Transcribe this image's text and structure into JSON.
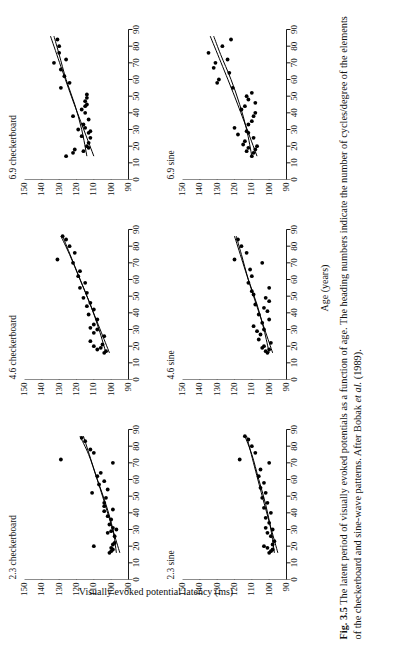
{
  "figure": {
    "caption_label": "Fig. 3.5",
    "caption_text_1": "The latent period of visually evoked potentials as a function of age. The heading numbers",
    "caption_text_2": "indicate the number of cycles/degree of the elements of the checkerboard and sine-wave patterns. After",
    "caption_text_3_pre": "Bobak ",
    "caption_text_3_ital": "et al.",
    "caption_text_3_post": " (1989)."
  },
  "chart_data": {
    "type": "scatter",
    "title": "The latent period of visually evoked potentials as a function of age",
    "xlabel": "Age (years)",
    "ylabel": "Visually evoked potential latency (ms)",
    "xlim": [
      0,
      90
    ],
    "ylim": [
      90,
      150
    ],
    "xticks": [
      0,
      10,
      20,
      30,
      40,
      50,
      60,
      70,
      80,
      90
    ],
    "yticks": [
      90,
      100,
      110,
      120,
      130,
      140,
      150
    ],
    "grid": false,
    "legend": "none",
    "annotation": "Each panel heading gives cycles/degree of the pattern elements; two fitted curves (linear and quadratic regression) are drawn on each panel.",
    "panels": [
      {
        "id": "panel-2-3-checkerboard",
        "title": "2.3 checkerboard",
        "row": 0,
        "col": 0,
        "spatial_frequency_cpd": 2.3,
        "pattern": "checkerboard",
        "points": [
          {
            "x": 16,
            "y": 101
          },
          {
            "x": 17,
            "y": 100
          },
          {
            "x": 18,
            "y": 99
          },
          {
            "x": 19,
            "y": 100
          },
          {
            "x": 20,
            "y": 110
          },
          {
            "x": 21,
            "y": 99
          },
          {
            "x": 22,
            "y": 98
          },
          {
            "x": 26,
            "y": 98
          },
          {
            "x": 28,
            "y": 102
          },
          {
            "x": 29,
            "y": 100
          },
          {
            "x": 30,
            "y": 97
          },
          {
            "x": 31,
            "y": 99
          },
          {
            "x": 33,
            "y": 101
          },
          {
            "x": 36,
            "y": 100
          },
          {
            "x": 38,
            "y": 102
          },
          {
            "x": 41,
            "y": 104
          },
          {
            "x": 42,
            "y": 99
          },
          {
            "x": 44,
            "y": 104
          },
          {
            "x": 46,
            "y": 104
          },
          {
            "x": 49,
            "y": 103
          },
          {
            "x": 52,
            "y": 111
          },
          {
            "x": 54,
            "y": 102
          },
          {
            "x": 57,
            "y": 107
          },
          {
            "x": 59,
            "y": 104
          },
          {
            "x": 62,
            "y": 108
          },
          {
            "x": 64,
            "y": 106
          },
          {
            "x": 70,
            "y": 99
          },
          {
            "x": 72,
            "y": 129
          },
          {
            "x": 76,
            "y": 110
          },
          {
            "x": 78,
            "y": 112
          },
          {
            "x": 83,
            "y": 115
          },
          {
            "x": 85,
            "y": 117
          }
        ],
        "fit_quadratic": [
          {
            "x": 16,
            "y": 97
          },
          {
            "x": 30,
            "y": 99
          },
          {
            "x": 45,
            "y": 103
          },
          {
            "x": 60,
            "y": 108
          },
          {
            "x": 75,
            "y": 113
          },
          {
            "x": 86,
            "y": 118
          }
        ],
        "fit_linear": [
          {
            "x": 16,
            "y": 95
          },
          {
            "x": 50,
            "y": 105
          },
          {
            "x": 86,
            "y": 116
          }
        ]
      },
      {
        "id": "panel-4-6-checkerboard",
        "title": "4.6 checkerboard",
        "row": 0,
        "col": 1,
        "spatial_frequency_cpd": 4.6,
        "pattern": "checkerboard",
        "points": [
          {
            "x": 16,
            "y": 104
          },
          {
            "x": 17,
            "y": 103
          },
          {
            "x": 18,
            "y": 108
          },
          {
            "x": 19,
            "y": 106
          },
          {
            "x": 20,
            "y": 110
          },
          {
            "x": 21,
            "y": 105
          },
          {
            "x": 23,
            "y": 112
          },
          {
            "x": 26,
            "y": 104
          },
          {
            "x": 28,
            "y": 110
          },
          {
            "x": 30,
            "y": 108
          },
          {
            "x": 31,
            "y": 112
          },
          {
            "x": 33,
            "y": 110
          },
          {
            "x": 36,
            "y": 108
          },
          {
            "x": 39,
            "y": 113
          },
          {
            "x": 42,
            "y": 110
          },
          {
            "x": 44,
            "y": 114
          },
          {
            "x": 46,
            "y": 112
          },
          {
            "x": 49,
            "y": 116
          },
          {
            "x": 52,
            "y": 114
          },
          {
            "x": 55,
            "y": 118
          },
          {
            "x": 58,
            "y": 115
          },
          {
            "x": 62,
            "y": 119
          },
          {
            "x": 65,
            "y": 118
          },
          {
            "x": 70,
            "y": 122
          },
          {
            "x": 72,
            "y": 131
          },
          {
            "x": 76,
            "y": 121
          },
          {
            "x": 80,
            "y": 124
          },
          {
            "x": 84,
            "y": 126
          },
          {
            "x": 86,
            "y": 128
          }
        ],
        "fit_quadratic": [
          {
            "x": 16,
            "y": 103
          },
          {
            "x": 30,
            "y": 107
          },
          {
            "x": 45,
            "y": 112
          },
          {
            "x": 60,
            "y": 118
          },
          {
            "x": 75,
            "y": 124
          },
          {
            "x": 86,
            "y": 129
          }
        ],
        "fit_linear": [
          {
            "x": 16,
            "y": 101
          },
          {
            "x": 50,
            "y": 114
          },
          {
            "x": 86,
            "y": 128
          }
        ]
      },
      {
        "id": "panel-6-9-checkerboard",
        "title": "6.9 checkerboard",
        "row": 0,
        "col": 2,
        "spatial_frequency_cpd": 6.9,
        "pattern": "checkerboard",
        "points": [
          {
            "x": 14,
            "y": 126
          },
          {
            "x": 16,
            "y": 122
          },
          {
            "x": 17,
            "y": 116
          },
          {
            "x": 18,
            "y": 121
          },
          {
            "x": 19,
            "y": 113
          },
          {
            "x": 20,
            "y": 114
          },
          {
            "x": 22,
            "y": 113
          },
          {
            "x": 25,
            "y": 112
          },
          {
            "x": 26,
            "y": 117
          },
          {
            "x": 28,
            "y": 113
          },
          {
            "x": 29,
            "y": 112
          },
          {
            "x": 30,
            "y": 119
          },
          {
            "x": 31,
            "y": 115
          },
          {
            "x": 33,
            "y": 116
          },
          {
            "x": 36,
            "y": 113
          },
          {
            "x": 38,
            "y": 122
          },
          {
            "x": 40,
            "y": 115
          },
          {
            "x": 42,
            "y": 117
          },
          {
            "x": 44,
            "y": 115
          },
          {
            "x": 45,
            "y": 114
          },
          {
            "x": 47,
            "y": 115
          },
          {
            "x": 49,
            "y": 114
          },
          {
            "x": 51,
            "y": 114
          },
          {
            "x": 55,
            "y": 129
          },
          {
            "x": 58,
            "y": 124
          },
          {
            "x": 62,
            "y": 127
          },
          {
            "x": 66,
            "y": 129
          },
          {
            "x": 70,
            "y": 133
          },
          {
            "x": 72,
            "y": 126
          },
          {
            "x": 76,
            "y": 130
          },
          {
            "x": 80,
            "y": 130
          },
          {
            "x": 84,
            "y": 131
          }
        ],
        "fit_quadratic": [
          {
            "x": 14,
            "y": 114
          },
          {
            "x": 30,
            "y": 117
          },
          {
            "x": 45,
            "y": 121
          },
          {
            "x": 60,
            "y": 126
          },
          {
            "x": 75,
            "y": 130
          },
          {
            "x": 86,
            "y": 133
          }
        ],
        "fit_linear": [
          {
            "x": 14,
            "y": 110
          },
          {
            "x": 50,
            "y": 123
          },
          {
            "x": 86,
            "y": 135
          }
        ]
      },
      {
        "id": "panel-2-3-sine",
        "title": "2.3 sine",
        "row": 1,
        "col": 0,
        "spatial_frequency_cpd": 2.3,
        "pattern": "sine",
        "points": [
          {
            "x": 16,
            "y": 100
          },
          {
            "x": 17,
            "y": 99
          },
          {
            "x": 18,
            "y": 98
          },
          {
            "x": 19,
            "y": 101
          },
          {
            "x": 20,
            "y": 103
          },
          {
            "x": 21,
            "y": 98
          },
          {
            "x": 23,
            "y": 97
          },
          {
            "x": 26,
            "y": 99
          },
          {
            "x": 28,
            "y": 101
          },
          {
            "x": 30,
            "y": 98
          },
          {
            "x": 31,
            "y": 102
          },
          {
            "x": 34,
            "y": 100
          },
          {
            "x": 37,
            "y": 102
          },
          {
            "x": 40,
            "y": 99
          },
          {
            "x": 43,
            "y": 103
          },
          {
            "x": 46,
            "y": 101
          },
          {
            "x": 49,
            "y": 104
          },
          {
            "x": 52,
            "y": 102
          },
          {
            "x": 55,
            "y": 105
          },
          {
            "x": 58,
            "y": 103
          },
          {
            "x": 62,
            "y": 106
          },
          {
            "x": 66,
            "y": 105
          },
          {
            "x": 70,
            "y": 100
          },
          {
            "x": 72,
            "y": 117
          },
          {
            "x": 76,
            "y": 108
          },
          {
            "x": 80,
            "y": 110
          },
          {
            "x": 84,
            "y": 112
          },
          {
            "x": 86,
            "y": 114
          }
        ],
        "fit_quadratic": [
          {
            "x": 16,
            "y": 97
          },
          {
            "x": 30,
            "y": 99
          },
          {
            "x": 45,
            "y": 102
          },
          {
            "x": 60,
            "y": 106
          },
          {
            "x": 75,
            "y": 110
          },
          {
            "x": 86,
            "y": 114
          }
        ],
        "fit_linear": [
          {
            "x": 16,
            "y": 95
          },
          {
            "x": 50,
            "y": 104
          },
          {
            "x": 86,
            "y": 113
          }
        ]
      },
      {
        "id": "panel-4-6-sine",
        "title": "4.6 sine",
        "row": 1,
        "col": 1,
        "spatial_frequency_cpd": 4.6,
        "pattern": "sine",
        "points": [
          {
            "x": 16,
            "y": 101
          },
          {
            "x": 17,
            "y": 102
          },
          {
            "x": 18,
            "y": 100
          },
          {
            "x": 19,
            "y": 104
          },
          {
            "x": 20,
            "y": 103
          },
          {
            "x": 22,
            "y": 99
          },
          {
            "x": 24,
            "y": 106
          },
          {
            "x": 27,
            "y": 105
          },
          {
            "x": 29,
            "y": 107
          },
          {
            "x": 30,
            "y": 103
          },
          {
            "x": 32,
            "y": 109
          },
          {
            "x": 34,
            "y": 104
          },
          {
            "x": 36,
            "y": 100
          },
          {
            "x": 39,
            "y": 106
          },
          {
            "x": 41,
            "y": 101
          },
          {
            "x": 43,
            "y": 103
          },
          {
            "x": 45,
            "y": 108
          },
          {
            "x": 47,
            "y": 100
          },
          {
            "x": 49,
            "y": 102
          },
          {
            "x": 51,
            "y": 109
          },
          {
            "x": 53,
            "y": 110
          },
          {
            "x": 55,
            "y": 100
          },
          {
            "x": 58,
            "y": 112
          },
          {
            "x": 62,
            "y": 110
          },
          {
            "x": 66,
            "y": 111
          },
          {
            "x": 70,
            "y": 104
          },
          {
            "x": 72,
            "y": 120
          },
          {
            "x": 76,
            "y": 113
          },
          {
            "x": 80,
            "y": 116
          },
          {
            "x": 84,
            "y": 118
          }
        ],
        "fit_quadratic": [
          {
            "x": 16,
            "y": 100
          },
          {
            "x": 30,
            "y": 103
          },
          {
            "x": 45,
            "y": 107
          },
          {
            "x": 60,
            "y": 112
          },
          {
            "x": 75,
            "y": 116
          },
          {
            "x": 86,
            "y": 119
          }
        ],
        "fit_linear": [
          {
            "x": 16,
            "y": 98
          },
          {
            "x": 50,
            "y": 109
          },
          {
            "x": 86,
            "y": 120
          }
        ]
      },
      {
        "id": "panel-6-9-sine",
        "title": "6.9 sine",
        "row": 1,
        "col": 2,
        "spatial_frequency_cpd": 6.9,
        "pattern": "sine",
        "points": [
          {
            "x": 14,
            "y": 110
          },
          {
            "x": 16,
            "y": 109
          },
          {
            "x": 17,
            "y": 113
          },
          {
            "x": 18,
            "y": 108
          },
          {
            "x": 19,
            "y": 112
          },
          {
            "x": 20,
            "y": 107
          },
          {
            "x": 21,
            "y": 115
          },
          {
            "x": 23,
            "y": 114
          },
          {
            "x": 25,
            "y": 109
          },
          {
            "x": 27,
            "y": 118
          },
          {
            "x": 28,
            "y": 112
          },
          {
            "x": 29,
            "y": 113
          },
          {
            "x": 31,
            "y": 120
          },
          {
            "x": 33,
            "y": 112
          },
          {
            "x": 35,
            "y": 110
          },
          {
            "x": 38,
            "y": 109
          },
          {
            "x": 40,
            "y": 108
          },
          {
            "x": 42,
            "y": 116
          },
          {
            "x": 44,
            "y": 114
          },
          {
            "x": 46,
            "y": 108
          },
          {
            "x": 48,
            "y": 112
          },
          {
            "x": 50,
            "y": 113
          },
          {
            "x": 52,
            "y": 110
          },
          {
            "x": 55,
            "y": 121
          },
          {
            "x": 58,
            "y": 130
          },
          {
            "x": 60,
            "y": 129
          },
          {
            "x": 64,
            "y": 123
          },
          {
            "x": 67,
            "y": 132
          },
          {
            "x": 70,
            "y": 131
          },
          {
            "x": 72,
            "y": 124
          },
          {
            "x": 76,
            "y": 135
          },
          {
            "x": 80,
            "y": 127
          },
          {
            "x": 84,
            "y": 122
          }
        ],
        "fit_quadratic": [
          {
            "x": 14,
            "y": 110
          },
          {
            "x": 30,
            "y": 113
          },
          {
            "x": 45,
            "y": 117
          },
          {
            "x": 60,
            "y": 122
          },
          {
            "x": 75,
            "y": 128
          },
          {
            "x": 86,
            "y": 132
          }
        ],
        "fit_linear": [
          {
            "x": 14,
            "y": 107
          },
          {
            "x": 50,
            "y": 120
          },
          {
            "x": 86,
            "y": 134
          }
        ]
      }
    ]
  }
}
